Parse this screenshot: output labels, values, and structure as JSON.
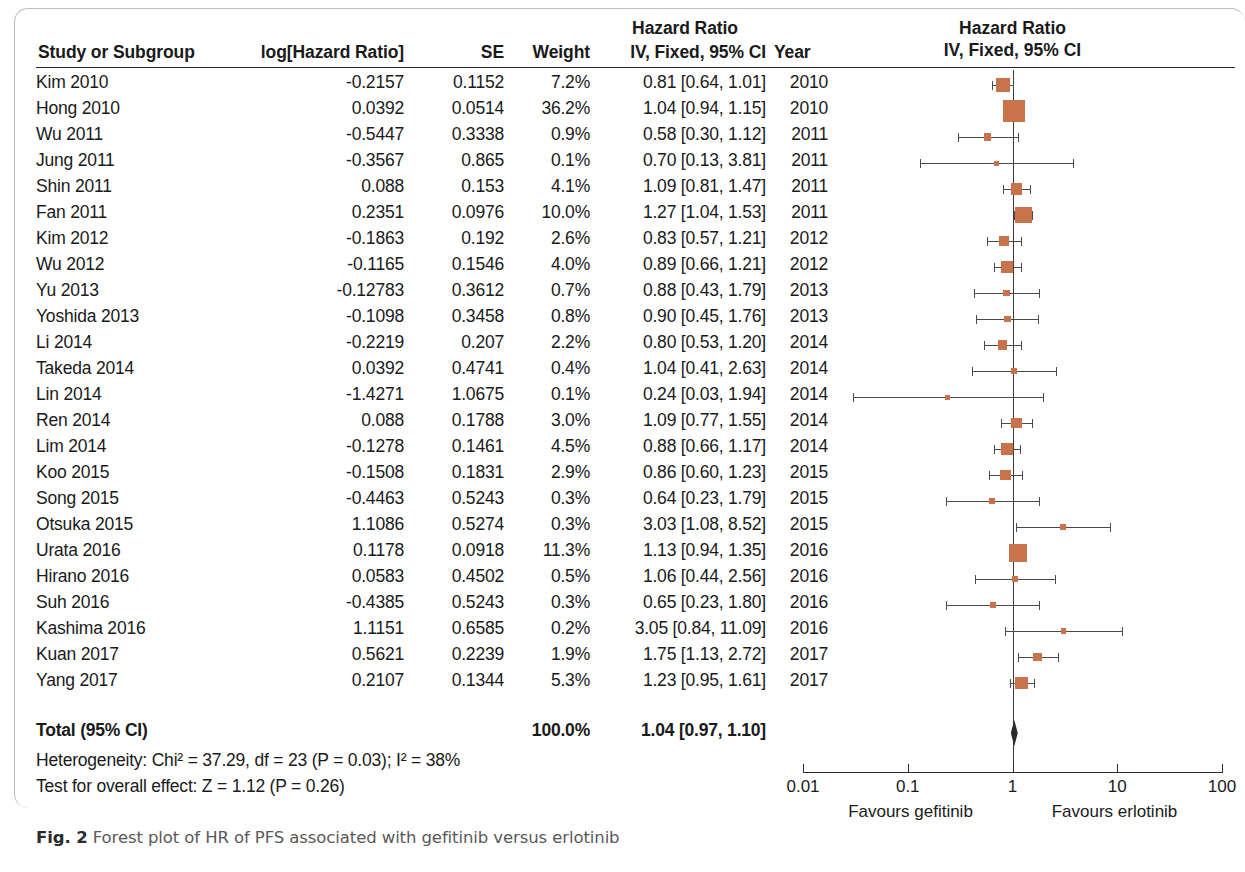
{
  "figure": {
    "caption_label": "Fig. 2",
    "caption_text": "Forest plot of HR of PFS associated with gefitinib versus erlotinib"
  },
  "table": {
    "headers": {
      "study": "Study or Subgroup",
      "log_hr": "log[Hazard Ratio]",
      "se": "SE",
      "weight": "Weight",
      "hazard_ratio_top": "Hazard Ratio",
      "ci": "IV, Fixed, 95% CI",
      "year": "Year"
    },
    "total": {
      "label": "Total (95% CI)",
      "weight": "100.0%",
      "ci": "1.04 [0.97, 1.10]"
    },
    "heterogeneity": "Heterogeneity: Chi² = 37.29, df = 23 (P = 0.03); I² = 38%",
    "overall_effect": "Test for overall effect: Z = 1.12 (P = 0.26)"
  },
  "plot": {
    "title": "Hazard Ratio",
    "subtitle": "IV, Fixed, 95% CI",
    "tick_labels": [
      "0.01",
      "0.1",
      "1",
      "10",
      "100"
    ],
    "favours_left": "Favours gefitinib",
    "favours_right": "Favours erlotinib",
    "marker_color": "#c8734c",
    "line_color": "#4a4a4a"
  },
  "chart_data": {
    "type": "forest",
    "title": "Hazard Ratio",
    "subtitle": "IV, Fixed, 95% CI",
    "xlabel": "Hazard Ratio (log scale)",
    "xlim": [
      0.01,
      100
    ],
    "xticks": [
      0.01,
      0.1,
      1,
      10,
      100
    ],
    "null_value": 1,
    "favours_left": "Favours gefitinib",
    "favours_right": "Favours erlotinib",
    "columns": [
      "Study or Subgroup",
      "log[Hazard Ratio]",
      "SE",
      "Weight",
      "IV, Fixed, 95% CI",
      "Year"
    ],
    "rows": [
      {
        "study": "Kim 2010",
        "log_hr": "-0.2157",
        "se": "0.1152",
        "weight": "7.2%",
        "ci": "0.81 [0.64, 1.01]",
        "year": "2010",
        "hr": 0.81,
        "lo": 0.64,
        "hi": 1.01,
        "w": 7.2
      },
      {
        "study": "Hong 2010",
        "log_hr": "0.0392",
        "se": "0.0514",
        "weight": "36.2%",
        "ci": "1.04 [0.94, 1.15]",
        "year": "2010",
        "hr": 1.04,
        "lo": 0.94,
        "hi": 1.15,
        "w": 36.2
      },
      {
        "study": "Wu 2011",
        "log_hr": "-0.5447",
        "se": "0.3338",
        "weight": "0.9%",
        "ci": "0.58 [0.30, 1.12]",
        "year": "2011",
        "hr": 0.58,
        "lo": 0.3,
        "hi": 1.12,
        "w": 0.9
      },
      {
        "study": "Jung 2011",
        "log_hr": "-0.3567",
        "se": "0.865",
        "weight": "0.1%",
        "ci": "0.70 [0.13, 3.81]",
        "year": "2011",
        "hr": 0.7,
        "lo": 0.13,
        "hi": 3.81,
        "w": 0.1
      },
      {
        "study": "Shin 2011",
        "log_hr": "0.088",
        "se": "0.153",
        "weight": "4.1%",
        "ci": "1.09 [0.81, 1.47]",
        "year": "2011",
        "hr": 1.09,
        "lo": 0.81,
        "hi": 1.47,
        "w": 4.1
      },
      {
        "study": "Fan 2011",
        "log_hr": "0.2351",
        "se": "0.0976",
        "weight": "10.0%",
        "ci": "1.27 [1.04, 1.53]",
        "year": "2011",
        "hr": 1.27,
        "lo": 1.04,
        "hi": 1.53,
        "w": 10.0
      },
      {
        "study": "Kim 2012",
        "log_hr": "-0.1863",
        "se": "0.192",
        "weight": "2.6%",
        "ci": "0.83 [0.57, 1.21]",
        "year": "2012",
        "hr": 0.83,
        "lo": 0.57,
        "hi": 1.21,
        "w": 2.6
      },
      {
        "study": "Wu 2012",
        "log_hr": "-0.1165",
        "se": "0.1546",
        "weight": "4.0%",
        "ci": "0.89 [0.66, 1.21]",
        "year": "2012",
        "hr": 0.89,
        "lo": 0.66,
        "hi": 1.21,
        "w": 4.0
      },
      {
        "study": "Yu 2013",
        "log_hr": "-0.12783",
        "se": "0.3612",
        "weight": "0.7%",
        "ci": "0.88 [0.43, 1.79]",
        "year": "2013",
        "hr": 0.88,
        "lo": 0.43,
        "hi": 1.79,
        "w": 0.7
      },
      {
        "study": "Yoshida 2013",
        "log_hr": "-0.1098",
        "se": "0.3458",
        "weight": "0.8%",
        "ci": "0.90 [0.45, 1.76]",
        "year": "2013",
        "hr": 0.9,
        "lo": 0.45,
        "hi": 1.76,
        "w": 0.8
      },
      {
        "study": "Li 2014",
        "log_hr": "-0.2219",
        "se": "0.207",
        "weight": "2.2%",
        "ci": "0.80 [0.53, 1.20]",
        "year": "2014",
        "hr": 0.8,
        "lo": 0.53,
        "hi": 1.2,
        "w": 2.2
      },
      {
        "study": "Takeda 2014",
        "log_hr": "0.0392",
        "se": "0.4741",
        "weight": "0.4%",
        "ci": "1.04 [0.41, 2.63]",
        "year": "2014",
        "hr": 1.04,
        "lo": 0.41,
        "hi": 2.63,
        "w": 0.4
      },
      {
        "study": "Lin 2014",
        "log_hr": "-1.4271",
        "se": "1.0675",
        "weight": "0.1%",
        "ci": "0.24 [0.03, 1.94]",
        "year": "2014",
        "hr": 0.24,
        "lo": 0.03,
        "hi": 1.94,
        "w": 0.1
      },
      {
        "study": "Ren 2014",
        "log_hr": "0.088",
        "se": "0.1788",
        "weight": "3.0%",
        "ci": "1.09 [0.77, 1.55]",
        "year": "2014",
        "hr": 1.09,
        "lo": 0.77,
        "hi": 1.55,
        "w": 3.0
      },
      {
        "study": "Lim 2014",
        "log_hr": "-0.1278",
        "se": "0.1461",
        "weight": "4.5%",
        "ci": "0.88 [0.66, 1.17]",
        "year": "2014",
        "hr": 0.88,
        "lo": 0.66,
        "hi": 1.17,
        "w": 4.5
      },
      {
        "study": "Koo 2015",
        "log_hr": "-0.1508",
        "se": "0.1831",
        "weight": "2.9%",
        "ci": "0.86 [0.60, 1.23]",
        "year": "2015",
        "hr": 0.86,
        "lo": 0.6,
        "hi": 1.23,
        "w": 2.9
      },
      {
        "study": "Song 2015",
        "log_hr": "-0.4463",
        "se": "0.5243",
        "weight": "0.3%",
        "ci": "0.64 [0.23, 1.79]",
        "year": "2015",
        "hr": 0.64,
        "lo": 0.23,
        "hi": 1.79,
        "w": 0.3
      },
      {
        "study": "Otsuka 2015",
        "log_hr": "1.1086",
        "se": "0.5274",
        "weight": "0.3%",
        "ci": "3.03 [1.08, 8.52]",
        "year": "2015",
        "hr": 3.03,
        "lo": 1.08,
        "hi": 8.52,
        "w": 0.3
      },
      {
        "study": "Urata 2016",
        "log_hr": "0.1178",
        "se": "0.0918",
        "weight": "11.3%",
        "ci": "1.13 [0.94, 1.35]",
        "year": "2016",
        "hr": 1.13,
        "lo": 0.94,
        "hi": 1.35,
        "w": 11.3
      },
      {
        "study": "Hirano 2016",
        "log_hr": "0.0583",
        "se": "0.4502",
        "weight": "0.5%",
        "ci": "1.06 [0.44, 2.56]",
        "year": "2016",
        "hr": 1.06,
        "lo": 0.44,
        "hi": 2.56,
        "w": 0.5
      },
      {
        "study": "Suh 2016",
        "log_hr": "-0.4385",
        "se": "0.5243",
        "weight": "0.3%",
        "ci": "0.65 [0.23, 1.80]",
        "year": "2016",
        "hr": 0.65,
        "lo": 0.23,
        "hi": 1.8,
        "w": 0.3
      },
      {
        "study": "Kashima 2016",
        "log_hr": "1.1151",
        "se": "0.6585",
        "weight": "0.2%",
        "ci": "3.05 [0.84, 11.09]",
        "year": "2016",
        "hr": 3.05,
        "lo": 0.84,
        "hi": 11.09,
        "w": 0.2
      },
      {
        "study": "Kuan 2017",
        "log_hr": "0.5621",
        "se": "0.2239",
        "weight": "1.9%",
        "ci": "1.75 [1.13, 2.72]",
        "year": "2017",
        "hr": 1.75,
        "lo": 1.13,
        "hi": 2.72,
        "w": 1.9
      },
      {
        "study": "Yang 2017",
        "log_hr": "0.2107",
        "se": "0.1344",
        "weight": "5.3%",
        "ci": "1.23 [0.95, 1.61]",
        "year": "2017",
        "hr": 1.23,
        "lo": 0.95,
        "hi": 1.61,
        "w": 5.3
      }
    ],
    "total": {
      "label": "Total (95% CI)",
      "weight": "100.0%",
      "ci": "1.04 [0.97, 1.10]",
      "hr": 1.04,
      "lo": 0.97,
      "hi": 1.1
    },
    "heterogeneity": "Heterogeneity: Chi² = 37.29, df = 23 (P = 0.03); I² = 38%",
    "overall_effect": "Test for overall effect: Z = 1.12 (P = 0.26)"
  }
}
